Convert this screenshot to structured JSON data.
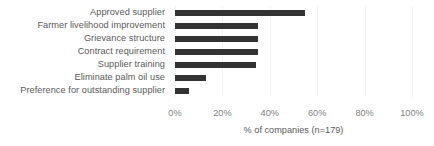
{
  "chart_data": {
    "type": "bar",
    "orientation": "horizontal",
    "title": "",
    "subtitle": "",
    "xlabel": "% of companies (n=179)",
    "ylabel": "",
    "categories": [
      "Approved supplier",
      "Farmer livelihood improvement",
      "Grievance structure",
      "Contract requirement",
      "Supplier training",
      "Eliminate palm oil use",
      "Preference for outstanding supplier"
    ],
    "values": [
      55,
      35,
      35,
      35,
      34,
      13,
      6
    ],
    "xlim": [
      0,
      100
    ],
    "xticks": [
      0,
      20,
      40,
      60,
      80,
      100
    ],
    "xtick_labels": [
      "0%",
      "20%",
      "40%",
      "60%",
      "80%",
      "100%"
    ],
    "grid": "vertical-only",
    "legend": "none",
    "bar_color": "#333333",
    "label_color": "#595959",
    "tick_color": "#808080",
    "gridline_color": "#F2F2F2",
    "background": "#FFFFFF"
  }
}
